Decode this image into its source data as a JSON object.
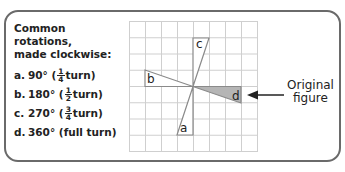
{
  "panel": {
    "title_line1": "Common rotations,",
    "title_line2": "made clockwise:",
    "items": [
      {
        "letter": "a.",
        "degrees": "90°",
        "open": "(",
        "frac_num": "1",
        "frac_den": "4",
        "rest": "turn)"
      },
      {
        "letter": "b.",
        "degrees": "180°",
        "open": "(",
        "frac_num": "1",
        "frac_den": "2",
        "rest": "turn)"
      },
      {
        "letter": "c.",
        "degrees": "270°",
        "open": "(",
        "frac_num": "3",
        "frac_den": "4",
        "rest": "turn)"
      },
      {
        "letter": "d.",
        "degrees": "360°",
        "text": "(full turn)"
      }
    ]
  },
  "figure": {
    "labels": {
      "a": "a",
      "b": "b",
      "c": "c",
      "d": "d"
    },
    "shaded_color": "#b5b5b5",
    "grid_color": "#cfcfcf",
    "callout_line1": "Original",
    "callout_line2": "figure"
  }
}
